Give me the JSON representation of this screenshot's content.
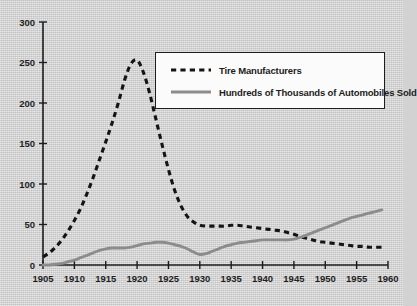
{
  "chart_data": {
    "type": "line",
    "title": "",
    "subtitle": "",
    "xlabel": "",
    "ylabel": "",
    "xlim": [
      1905,
      1960
    ],
    "ylim": [
      0,
      300
    ],
    "grid": false,
    "legend_position": "top-right-inside",
    "x_ticks": [
      "1905",
      "1910",
      "1915",
      "1920",
      "1925",
      "1930",
      "1935",
      "1940",
      "1945",
      "1950",
      "1955",
      "1960"
    ],
    "y_ticks": [
      "0",
      "50",
      "100",
      "150",
      "200",
      "250",
      "300"
    ],
    "series": [
      {
        "name": "Tire Manufacturers",
        "style": "dashed",
        "color": "#141414",
        "x": [
          1905,
          1906,
          1907,
          1908,
          1909,
          1910,
          1911,
          1912,
          1913,
          1914,
          1915,
          1916,
          1917,
          1918,
          1919,
          1920,
          1921,
          1922,
          1923,
          1924,
          1925,
          1926,
          1927,
          1928,
          1929,
          1930,
          1931,
          1932,
          1933,
          1934,
          1935,
          1936,
          1937,
          1938,
          1939,
          1940,
          1941,
          1942,
          1943,
          1944,
          1945,
          1946,
          1947,
          1948,
          1949,
          1950,
          1951,
          1952,
          1953,
          1954,
          1955,
          1956,
          1957,
          1958,
          1959
        ],
        "values": [
          10,
          15,
          22,
          31,
          42,
          55,
          70,
          88,
          108,
          130,
          152,
          175,
          200,
          228,
          248,
          253,
          238,
          212,
          180,
          148,
          118,
          92,
          73,
          60,
          53,
          49,
          48,
          48,
          48,
          48,
          49,
          49,
          48,
          47,
          46,
          45,
          44,
          43,
          42,
          40,
          38,
          35,
          33,
          31,
          29,
          28,
          27,
          26,
          25,
          24,
          23,
          23,
          22,
          22,
          22
        ]
      },
      {
        "name": "Hundreds of Thousands of Automobiles Sold",
        "style": "solid",
        "color": "#8c8c8c",
        "x": [
          1905,
          1906,
          1907,
          1908,
          1909,
          1910,
          1911,
          1912,
          1913,
          1914,
          1915,
          1916,
          1917,
          1918,
          1919,
          1920,
          1921,
          1922,
          1923,
          1924,
          1925,
          1926,
          1927,
          1928,
          1929,
          1930,
          1931,
          1932,
          1933,
          1934,
          1935,
          1936,
          1937,
          1938,
          1939,
          1940,
          1941,
          1942,
          1943,
          1944,
          1945,
          1946,
          1947,
          1948,
          1949,
          1950,
          1951,
          1952,
          1953,
          1954,
          1955,
          1956,
          1957,
          1958,
          1959
        ],
        "values": [
          0,
          0,
          1,
          2,
          4,
          6,
          9,
          12,
          15,
          18,
          20,
          21,
          21,
          21,
          22,
          24,
          26,
          27,
          28,
          28,
          27,
          25,
          23,
          20,
          16,
          13,
          14,
          17,
          20,
          23,
          25,
          27,
          28,
          29,
          30,
          31,
          31,
          31,
          31,
          31,
          32,
          34,
          37,
          40,
          43,
          46,
          49,
          52,
          55,
          58,
          60,
          62,
          64,
          66,
          68
        ]
      }
    ]
  },
  "legend": {
    "items": [
      {
        "label": "Tire Manufacturers",
        "swatch": "dashed-line-swatch"
      },
      {
        "label": "Hundreds of Thousands of Automobiles Sold",
        "swatch": "solid-line-swatch"
      }
    ]
  },
  "colors": {
    "background": "#d4d4d4",
    "axis": "#1c1c1c",
    "dashed_series": "#141414",
    "solid_series": "#8c8c8c",
    "legend_background": "#fbfbfb"
  }
}
